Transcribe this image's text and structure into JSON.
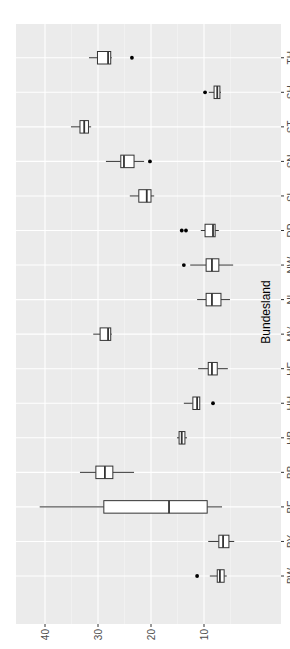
{
  "chart_data": {
    "type": "boxplot",
    "orientation": "rotated-90-ccw",
    "title": "",
    "xlabel": "Bundesland",
    "ylabel": "",
    "ylim": [
      3,
      42
    ],
    "yticks": [
      10,
      20,
      30,
      40
    ],
    "grid": true,
    "background": "#ebebeb",
    "categories": [
      "BW",
      "BY",
      "BE",
      "BB",
      "HB",
      "HH",
      "HE",
      "MV",
      "NI",
      "NW",
      "RP",
      "SL",
      "SN",
      "ST",
      "SH",
      "TH"
    ],
    "boxes": [
      {
        "cat": "BW",
        "lo": 5.7,
        "q1": 6.2,
        "med": 7.0,
        "q3": 7.5,
        "hi": 8.9,
        "outliers": [
          11.3
        ]
      },
      {
        "cat": "BY",
        "lo": 4.3,
        "q1": 5.3,
        "med": 6.4,
        "q3": 7.2,
        "hi": 9.2,
        "outliers": []
      },
      {
        "cat": "BE",
        "lo": 6.6,
        "q1": 9.4,
        "med": 16.6,
        "q3": 28.9,
        "hi": 41.0,
        "outliers": []
      },
      {
        "cat": "BB",
        "lo": 23.2,
        "q1": 27.2,
        "med": 28.7,
        "q3": 30.4,
        "hi": 33.4,
        "outliers": []
      },
      {
        "cat": "HB",
        "lo": 13.2,
        "q1": 13.6,
        "med": 14.2,
        "q3": 14.7,
        "hi": 15.1,
        "outliers": []
      },
      {
        "cat": "HH",
        "lo": 10.8,
        "q1": 10.8,
        "med": 11.3,
        "q3": 12.1,
        "hi": 13.8,
        "outliers": [
          8.3
        ]
      },
      {
        "cat": "HE",
        "lo": 5.5,
        "q1": 7.5,
        "med": 8.5,
        "q3": 9.2,
        "hi": 11.1,
        "outliers": []
      },
      {
        "cat": "MV",
        "lo": 27.4,
        "q1": 27.6,
        "med": 28.1,
        "q3": 29.6,
        "hi": 30.9,
        "outliers": []
      },
      {
        "cat": "NI",
        "lo": 5.1,
        "q1": 6.8,
        "med": 8.5,
        "q3": 9.6,
        "hi": 11.3,
        "outliers": []
      },
      {
        "cat": "NW",
        "lo": 4.5,
        "q1": 7.2,
        "med": 8.5,
        "q3": 9.6,
        "hi": 12.6,
        "outliers": [
          13.8
        ]
      },
      {
        "cat": "RP",
        "lo": 7.2,
        "q1": 7.9,
        "med": 8.3,
        "q3": 9.8,
        "hi": 10.6,
        "outliers": [
          13.4,
          14.2
        ]
      },
      {
        "cat": "SL",
        "lo": 19.4,
        "q1": 20.0,
        "med": 20.8,
        "q3": 22.3,
        "hi": 24.0,
        "outliers": []
      },
      {
        "cat": "SN",
        "lo": 21.3,
        "q1": 23.2,
        "med": 25.1,
        "q3": 25.7,
        "hi": 28.5,
        "outliers": [
          20.2
        ]
      },
      {
        "cat": "ST",
        "lo": 31.3,
        "q1": 31.8,
        "med": 32.6,
        "q3": 33.4,
        "hi": 35.1,
        "outliers": []
      },
      {
        "cat": "SH",
        "lo": 6.8,
        "q1": 7.0,
        "med": 7.5,
        "q3": 8.1,
        "hi": 9.1,
        "outliers": [
          9.8
        ]
      },
      {
        "cat": "TH",
        "lo": 27.4,
        "q1": 27.6,
        "med": 28.1,
        "q3": 30.1,
        "hi": 31.7,
        "outliers": [
          23.6
        ]
      }
    ]
  }
}
